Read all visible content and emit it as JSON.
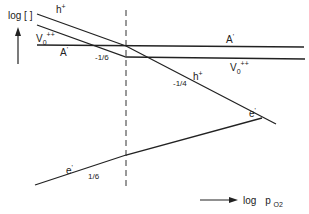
{
  "diagram": {
    "type": "defect-concentration (Brouwer) diagram",
    "y_axis": {
      "label": "log [ ]",
      "direction": "up"
    },
    "x_axis": {
      "label_prefix": "log",
      "label_var": "p",
      "label_sub": "O2",
      "direction": "right"
    },
    "divider": {
      "style": "dashed",
      "x": 126
    },
    "lines": [
      {
        "id": "h-plus",
        "label": "h",
        "label_sup": "+"
      },
      {
        "id": "v-oxygen",
        "label": "V",
        "label_sub": "0",
        "label_sup": "++"
      },
      {
        "id": "a-prime",
        "label": "A",
        "label_sup": "'"
      },
      {
        "id": "e-prime",
        "label": "e",
        "label_sup": "'"
      }
    ],
    "slopes": {
      "minus_one_sixth": "-1/6",
      "minus_one_quarter": "-1/4",
      "plus_one_sixth": "1/6"
    },
    "labels": {
      "h_left": "h",
      "h_left_sup": "+",
      "h_right": "h",
      "h_right_sup": "+",
      "v_left": "V",
      "v_left_sub": "0",
      "v_left_sup": "++",
      "v_right": "V",
      "v_right_sub": "0",
      "v_right_sup": "++",
      "a_left": "A",
      "a_left_sup": "'",
      "a_right": "A",
      "a_right_sup": "'",
      "e_left": "e",
      "e_left_sup": "'",
      "e_right": "e",
      "e_right_sup": "'",
      "slope_m16": "-1/6",
      "slope_m14": "-1/4",
      "slope_p16": "1/6",
      "y_axis": "log [ ]",
      "x_axis_log": "log",
      "x_axis_p": "p",
      "x_axis_sub": "O2"
    },
    "colors": {
      "ink": "#222222",
      "background": "#ffffff"
    }
  }
}
